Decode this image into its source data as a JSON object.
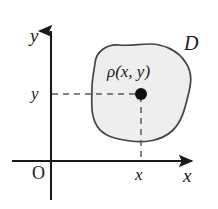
{
  "figure": {
    "type": "math-diagram",
    "background_color": "#ffffff",
    "ink_color": "#1a1a1a",
    "region_fill_color": "#eeeeee",
    "region_stroke_color": "#444444",
    "axes": {
      "y_axis_label": "y",
      "x_axis_label": "x",
      "origin_label": "O",
      "x_tick_label": "x",
      "y_tick_label": "y"
    },
    "annotations": {
      "region_label": "D",
      "density_label": "ρ(x, y)"
    },
    "point": {
      "x_px": 141,
      "y_px": 94,
      "radius_px": 6,
      "color": "#111111"
    },
    "geometry": {
      "y_axis_x_px": 51,
      "x_axis_y_px": 161,
      "y_axis_top_px": 28,
      "y_axis_bottom_px": 200,
      "x_axis_left_px": 12,
      "x_axis_right_px": 196,
      "region_outline_path": "M 95,63 C 96,52 106,44 119,45 C 131,46 139,44 150,44 C 163,44 178,50 186,63 C 193,74 191,84 188,96 C 185,108 182,122 172,131 C 161,141 144,143 130,141 C 115,139 103,136 97,126 C 90,115 92,100 92,88 C 92,78 94,72 95,63 Z"
    }
  }
}
